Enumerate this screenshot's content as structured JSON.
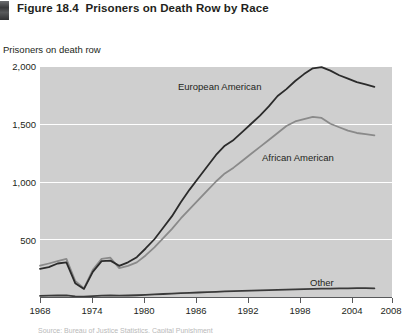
{
  "figure": {
    "marker_icon": "figure-bar-icon",
    "number": "Figure 18.4",
    "title": "Prisoners on Death Row by Race"
  },
  "source_note": "Source: Bureau of Justice Statistics, Capital Punishment",
  "chart_data": {
    "type": "line",
    "title": "Prisoners on Death Row by Race",
    "xlabel": "",
    "ylabel": "Prisoners on death row",
    "xlim": [
      1968,
      2008
    ],
    "ylim": [
      0,
      2000
    ],
    "grid": true,
    "legend": "inline-annotations",
    "xticks": [
      "1968",
      "1974",
      "1980",
      "1986",
      "1992",
      "1998",
      "2004",
      "2008"
    ],
    "yticks": [
      "500",
      "1,000",
      "1,500",
      "2,000"
    ],
    "x": [
      1968,
      1969,
      1970,
      1971,
      1972,
      1973,
      1974,
      1975,
      1976,
      1977,
      1978,
      1979,
      1980,
      1981,
      1982,
      1983,
      1984,
      1985,
      1986,
      1987,
      1988,
      1989,
      1990,
      1991,
      1992,
      1993,
      1994,
      1995,
      1996,
      1997,
      1998,
      1999,
      2000,
      2001,
      2002,
      2003,
      2004,
      2005,
      2006
    ],
    "series": [
      {
        "name": "European American",
        "color": "#2b2b2b",
        "values": [
          243,
          258,
          290,
          300,
          120,
          70,
          218,
          310,
          315,
          270,
          300,
          345,
          420,
          500,
          600,
          700,
          820,
          930,
          1030,
          1130,
          1230,
          1310,
          1360,
          1430,
          1500,
          1570,
          1650,
          1740,
          1800,
          1870,
          1930,
          1980,
          1990,
          1960,
          1920,
          1890,
          1860,
          1840,
          1820
        ]
      },
      {
        "name": "African American",
        "color": "#8a8a8a",
        "values": [
          271,
          290,
          310,
          330,
          140,
          75,
          235,
          330,
          340,
          250,
          270,
          300,
          360,
          430,
          510,
          590,
          680,
          760,
          840,
          920,
          1000,
          1070,
          1120,
          1180,
          1240,
          1300,
          1360,
          1420,
          1480,
          1520,
          1540,
          1560,
          1550,
          1500,
          1470,
          1440,
          1420,
          1410,
          1400
        ]
      },
      {
        "name": "Other",
        "color": "#3a3a3a",
        "values": [
          10,
          12,
          13,
          14,
          6,
          3,
          8,
          12,
          14,
          12,
          13,
          15,
          18,
          22,
          26,
          30,
          33,
          36,
          39,
          42,
          45,
          48,
          50,
          53,
          56,
          58,
          60,
          62,
          64,
          66,
          68,
          70,
          72,
          73,
          74,
          75,
          76,
          76,
          75
        ]
      }
    ],
    "annotations": [
      {
        "text": "European American",
        "x": 1990,
        "y": 1760
      },
      {
        "text": "African American",
        "x": 2000,
        "y": 1090
      },
      {
        "text": "Other",
        "x": 2005,
        "y": 175
      }
    ]
  }
}
